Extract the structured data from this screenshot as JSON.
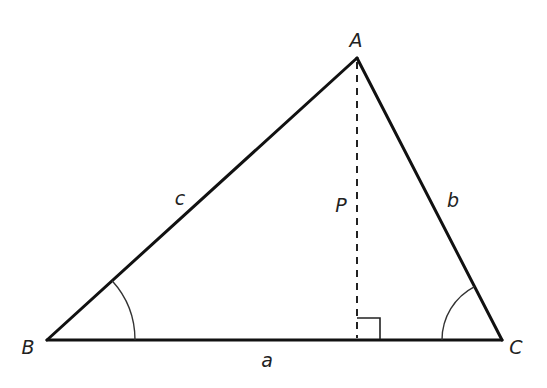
{
  "diagram": {
    "type": "triangle-with-altitude",
    "vertices": {
      "A": {
        "label": "A",
        "x": 357,
        "y": 58
      },
      "B": {
        "label": "B",
        "x": 47,
        "y": 340
      },
      "C": {
        "label": "C",
        "x": 502,
        "y": 340
      }
    },
    "sides": {
      "a": {
        "label": "a",
        "between": [
          "B",
          "C"
        ]
      },
      "b": {
        "label": "b",
        "between": [
          "A",
          "C"
        ]
      },
      "c": {
        "label": "c",
        "between": [
          "A",
          "B"
        ]
      }
    },
    "altitude": {
      "label": "P",
      "from": "A",
      "foot": {
        "x": 357,
        "y": 340
      },
      "style": "dashed"
    },
    "right_angle_marker": {
      "at": "foot",
      "size": 22
    },
    "angle_marks": [
      {
        "vertex": "B",
        "radius": 88
      },
      {
        "vertex": "C",
        "radius": 60
      }
    ],
    "colors": {
      "stroke": "#111111",
      "text": "#222222",
      "background": "#ffffff"
    }
  }
}
